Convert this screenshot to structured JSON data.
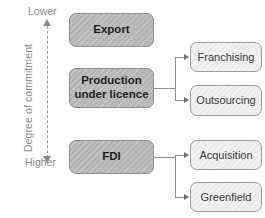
{
  "diagram": {
    "axis": {
      "name": "Degree of commitment",
      "top_cap": "Lower",
      "bottom_cap": "Higher",
      "top_arrow_icon": "arrow-up-icon",
      "bottom_arrow_icon": "arrow-down-icon"
    },
    "colors": {
      "primary_fill": "#b6b6b6",
      "primary_border": "#8f8f8f",
      "secondary_fill": "#ebebeb",
      "secondary_border": "#9e9e9e",
      "connector": "#8f8f8f",
      "label_text": "#8a8a8a",
      "background": "#ffffff"
    },
    "primary_nodes": [
      {
        "id": "export",
        "label": "Export"
      },
      {
        "id": "production",
        "label": "Production\nunder licence",
        "line1": "Production",
        "line2": "under licence"
      },
      {
        "id": "fdi",
        "label": "FDI"
      }
    ],
    "secondary_nodes": [
      {
        "id": "franchising",
        "label": "Franchising",
        "parent": "production"
      },
      {
        "id": "outsourcing",
        "label": "Outsourcing",
        "parent": "production"
      },
      {
        "id": "acquisition",
        "label": "Acquisition",
        "parent": "fdi"
      },
      {
        "id": "greenfield",
        "label": "Greenfield",
        "parent": "fdi"
      }
    ],
    "connectors": [
      {
        "from": "production",
        "to": [
          "franchising",
          "outsourcing"
        ]
      },
      {
        "from": "fdi",
        "to": [
          "acquisition",
          "greenfield"
        ]
      }
    ]
  }
}
